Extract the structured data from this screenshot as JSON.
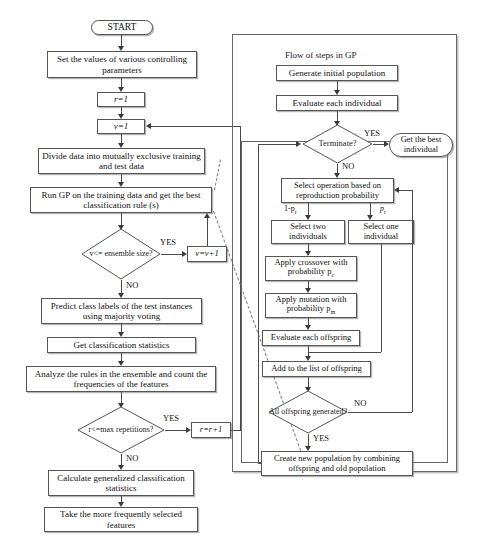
{
  "figure": {
    "type": "flowchart"
  },
  "left_flow": {
    "start": "START",
    "end": "END",
    "nodes": [
      {
        "id": "set-params",
        "shape": "process",
        "text": "Set  the values of various controlling parameters"
      },
      {
        "id": "r-init",
        "shape": "process",
        "text": "r=1"
      },
      {
        "id": "v-init",
        "shape": "process",
        "text": "v=1"
      },
      {
        "id": "divide-data",
        "shape": "process",
        "text": "Divide data into mutually exclusive training and test data"
      },
      {
        "id": "run-gp",
        "shape": "process",
        "text": "Run GP on the training data and get the best classification rule (s)"
      },
      {
        "id": "ensemble-check",
        "shape": "decision",
        "text": "v<= ensemble size?"
      },
      {
        "id": "v-increment",
        "shape": "process",
        "text": "v=v+1"
      },
      {
        "id": "predict",
        "shape": "process",
        "text": "Predict class labels of  the test instances using majority voting"
      },
      {
        "id": "get-stats",
        "shape": "process",
        "text": "Get classification statistics"
      },
      {
        "id": "analyze-rules",
        "shape": "process",
        "text": "Analyze the rules in the ensemble and count the frequencies of the features"
      },
      {
        "id": "reps-check",
        "shape": "decision",
        "text": "r<=max repetitions?"
      },
      {
        "id": "r-increment",
        "shape": "process",
        "text": "r=r+1"
      },
      {
        "id": "calc-generalized",
        "shape": "process",
        "text": "Calculate generalized classification statistics"
      },
      {
        "id": "take-features",
        "shape": "process",
        "text": "Take the more frequently selected features"
      }
    ],
    "edge_labels": {
      "ensemble_yes": "YES",
      "ensemble_no": "NO",
      "reps_yes": "YES",
      "reps_no": "NO"
    }
  },
  "gp_panel": {
    "title": "Flow of steps in GP",
    "nodes": [
      {
        "id": "gen-pop",
        "shape": "process",
        "text": "Generate initial population"
      },
      {
        "id": "eval-individual",
        "shape": "process",
        "text": "Evaluate each individual"
      },
      {
        "id": "terminate",
        "shape": "decision",
        "text": "Terminate?"
      },
      {
        "id": "get-best",
        "shape": "terminator",
        "text": "Get the best individual"
      },
      {
        "id": "select-operation",
        "shape": "process",
        "text": "Select  operation based on reproduction probability"
      },
      {
        "id": "select-two",
        "shape": "process",
        "text": "Select two individuals"
      },
      {
        "id": "select-one",
        "shape": "process",
        "text": "Select one individual"
      },
      {
        "id": "crossover",
        "shape": "process",
        "text": "Apply crossover with probability p",
        "sub": "c"
      },
      {
        "id": "mutation",
        "shape": "process",
        "text": "Apply mutation with probability p",
        "sub": "m"
      },
      {
        "id": "eval-offspring",
        "shape": "process",
        "text": "Evaluate each offspring"
      },
      {
        "id": "add-offspring",
        "shape": "process",
        "text": "Add to the list of offspring"
      },
      {
        "id": "all-offspring",
        "shape": "decision",
        "text": "All offspring generated?"
      },
      {
        "id": "create-pop",
        "shape": "process",
        "text": "Create new population by combining offspring and old population"
      }
    ],
    "edge_labels": {
      "terminate_yes": "YES",
      "terminate_no": "NO",
      "prob_not_reproduction": "1-p",
      "prob_not_reproduction_sub": "r",
      "prob_reproduction": "p",
      "prob_reproduction_sub": "r",
      "offspring_no": "NO",
      "offspring_yes": "YES"
    }
  },
  "colors": {
    "stroke": "#555555",
    "text": "#111111",
    "background": "#ffffff",
    "shadow": "#888888",
    "dashed": "#7a7a7a"
  }
}
